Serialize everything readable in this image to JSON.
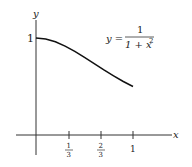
{
  "chart_data": {
    "type": "line",
    "title": "",
    "equation": {
      "lhs": "y =",
      "numerator": "1",
      "denominator": "1 + x",
      "exponent": "2"
    },
    "xlabel": "x",
    "ylabel": "y",
    "x_ticks": [
      {
        "num": "1",
        "den": "3"
      },
      {
        "num": "2",
        "den": "3"
      },
      {
        "whole": "1"
      }
    ],
    "y_ticks": [
      "1"
    ],
    "xlim": [
      0,
      1
    ],
    "ylim": [
      0,
      1
    ],
    "series": [
      {
        "name": "y = 1/(1+x^2)",
        "x": [
          0,
          0.1,
          0.2,
          0.3,
          0.4,
          0.5,
          0.6,
          0.7,
          0.8,
          0.9,
          1.0
        ],
        "y": [
          1,
          0.99,
          0.962,
          0.917,
          0.862,
          0.8,
          0.735,
          0.671,
          0.61,
          0.552,
          0.5
        ]
      }
    ],
    "grid": false
  }
}
